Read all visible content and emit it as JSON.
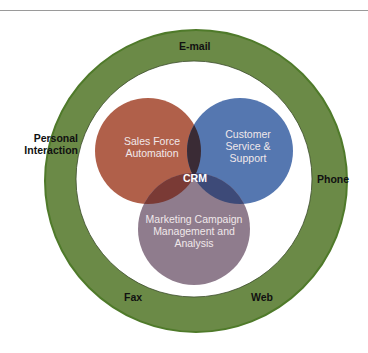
{
  "diagram": {
    "center_label": "CRM",
    "circles": [
      {
        "id": "sales",
        "label_line1": "Sales Force",
        "label_line2": "Automation",
        "color": "#b0604a"
      },
      {
        "id": "service",
        "label_line1": "Customer",
        "label_line2": "Service &",
        "label_line3": "Support",
        "color": "#5577b0"
      },
      {
        "id": "marketing",
        "label_line1": "Marketing Campaign",
        "label_line2": "Management and",
        "label_line3": "Analysis",
        "color": "#8f7c8d"
      }
    ],
    "channels": {
      "top": "E-mail",
      "left_line1": "Personal",
      "left_line2": "Interaction",
      "right": "Phone",
      "bottom_left": "Fax",
      "bottom_right": "Web"
    },
    "colors": {
      "ring": "#6b8a47",
      "ring_edge": "#4f7a2a",
      "sales_service_overlap": "#3a2b35",
      "sales_marketing_overlap": "#7a3a35",
      "service_marketing_overlap": "#3d4a78"
    }
  }
}
